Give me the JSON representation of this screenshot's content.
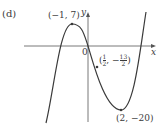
{
  "part_label": "(d)",
  "axes": {
    "x_label": "x",
    "y_label": "y",
    "origin_label": "0"
  },
  "points": {
    "max": {
      "label": "(−1, 7)",
      "x": -1,
      "y": 7
    },
    "inflection": {
      "label_open": "(",
      "x_num": "1",
      "x_den": "2",
      "sep": ", −",
      "y_num": "13",
      "y_den": "2",
      "label_close": ")",
      "x": 0.5,
      "y": -6.5
    },
    "min": {
      "label": "(2, −20)",
      "x": 2,
      "y": -20
    }
  },
  "curve": {
    "type": "cubic",
    "passes_through_origin": true,
    "color": "#3a3a3a"
  }
}
